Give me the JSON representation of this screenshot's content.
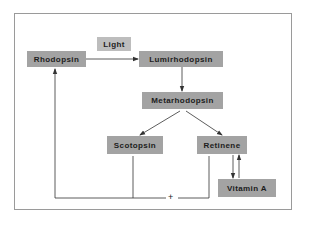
{
  "diagram": {
    "type": "flowchart",
    "nodes": {
      "rhodopsin": "Rhodopsin",
      "lumirhodopsin": "Lumirhodopsin",
      "metarhodopsin": "Metarhodopsin",
      "scotopsin": "Scotopsin",
      "retinene": "Retinene",
      "vitamin_a": "Vitamin A"
    },
    "edge_labels": {
      "light": "Light",
      "combine": "+"
    },
    "edges": [
      {
        "from": "Rhodopsin",
        "to": "Lumirhodopsin",
        "label": "Light"
      },
      {
        "from": "Lumirhodopsin",
        "to": "Metarhodopsin"
      },
      {
        "from": "Metarhodopsin",
        "to": "Scotopsin"
      },
      {
        "from": "Metarhodopsin",
        "to": "Retinene"
      },
      {
        "from": "Retinene",
        "to": "Vitamin A",
        "bidirectional": true
      },
      {
        "from": "Scotopsin + Retinene",
        "to": "Rhodopsin"
      }
    ],
    "colors": {
      "node_fill": "#a3a3a3",
      "label_fill": "#bdbdbd",
      "line": "#333333",
      "frame": "#9a9a9a"
    }
  }
}
